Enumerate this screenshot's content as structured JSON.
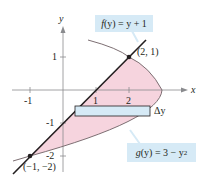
{
  "diagram": {
    "type": "region-between-curves",
    "axes": {
      "x_label": "x",
      "y_label": "y",
      "x_ticks": [
        "-1",
        "1",
        "2"
      ],
      "y_ticks": [
        "1",
        "-1",
        "-2"
      ]
    },
    "curves": [
      {
        "name": "f",
        "label": "f(y) = y + 1",
        "label_parts": {
          "fn": "f",
          "arg": "(y)",
          "rest": " = y + 1"
        }
      },
      {
        "name": "g",
        "label": "g(y) = 3 − y²",
        "label_parts": {
          "fn": "g",
          "arg": "(y)",
          "rest": " = 3 − y",
          "sup": "2"
        }
      }
    ],
    "points": [
      {
        "label": "(2, 1)"
      },
      {
        "label": "(−1, −2)"
      }
    ],
    "strip_label": "Δy",
    "colors": {
      "region_fill": "#f6d4de",
      "strip_fill": "#d6eaf6",
      "label_box": "#d6eaf6",
      "line": "#231f20",
      "curve": "#7d6f73",
      "axis": "#6d6e71"
    }
  }
}
